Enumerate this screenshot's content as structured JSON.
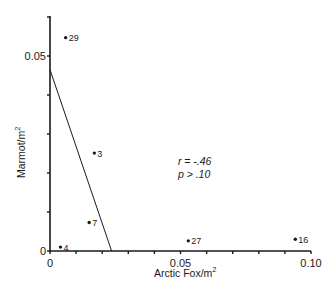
{
  "chart_data": {
    "type": "scatter",
    "title": "",
    "xlabel": "Arctic Fox/m",
    "xlabel_sup": "2",
    "ylabel": "Marmot/m",
    "ylabel_sup": "2",
    "xlim": [
      0,
      0.1
    ],
    "ylim": [
      0,
      0.06
    ],
    "x_major_ticks": [
      0,
      0.05,
      0.1
    ],
    "x_major_tick_labels": [
      "0",
      "0.05",
      "0.10"
    ],
    "x_minor_step": 0.01,
    "y_major_ticks": [
      0,
      0.05
    ],
    "y_major_tick_labels": [
      "0",
      "0.05"
    ],
    "y_minor_step": 0.01,
    "grid": false,
    "points": [
      {
        "label": "29",
        "x": 0.006,
        "y": 0.0547
      },
      {
        "label": "3",
        "x": 0.017,
        "y": 0.0251
      },
      {
        "label": "7",
        "x": 0.015,
        "y": 0.0073
      },
      {
        "label": "4",
        "x": 0.004,
        "y": 0.001
      },
      {
        "label": "27",
        "x": 0.053,
        "y": 0.0026
      },
      {
        "label": "16",
        "x": 0.094,
        "y": 0.003
      }
    ],
    "regression_line": {
      "x0": 0,
      "y0": 0.0465,
      "x1": 0.0236,
      "y1": 0
    },
    "annotations": [
      {
        "text": "r = -.46",
        "x": 0.049,
        "y": 0.022
      },
      {
        "text": "p > .10",
        "x": 0.049,
        "y": 0.0187
      }
    ],
    "colors": {
      "ink": "#1a1a1a",
      "background": "#ffffff"
    }
  }
}
